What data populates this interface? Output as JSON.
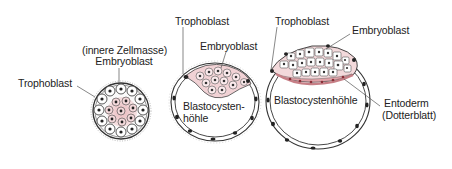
{
  "colors": {
    "ink": "#222222",
    "membrane": "#333333",
    "embryoblast_fill": "#f2d4d6",
    "embryoblast_dark": "#d89aa0",
    "entoderm_fill": "#e8a9ae",
    "nucleus": "#222222",
    "background": "#ffffff"
  },
  "stages": [
    {
      "id": "morula",
      "labels": {
        "trophoblast": "Trophoblast",
        "inner_cell_mass": "(innere Zellmasse)",
        "embryoblast": "Embryoblast"
      }
    },
    {
      "id": "early-blastocyst",
      "labels": {
        "trophoblast": "Trophoblast",
        "embryoblast": "Embryoblast",
        "cavity_line1": "Blastocysten-",
        "cavity_line2": "höhle"
      }
    },
    {
      "id": "late-blastocyst",
      "labels": {
        "trophoblast": "Trophoblast",
        "embryoblast": "Embryoblast",
        "cavity": "Blastocystenhöhle",
        "entoderm": "Entoderm",
        "entoderm_alt": "(Dotterblatt)"
      }
    }
  ]
}
